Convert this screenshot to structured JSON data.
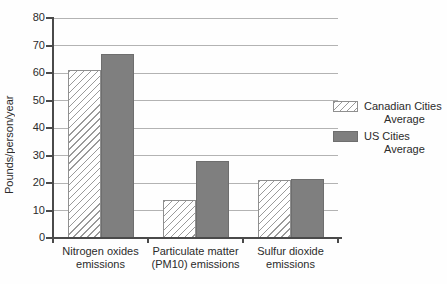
{
  "chart_data": {
    "type": "bar",
    "title": "",
    "xlabel": "",
    "ylabel": "Pounds/person/year",
    "ylim": [
      0,
      80
    ],
    "ytick_step": 10,
    "grid": true,
    "legend_position": "right",
    "categories": [
      "Nitrogen oxides emissions",
      "Particulate matter (PM10) emissions",
      "Sulfur dioxide emissions"
    ],
    "series": [
      {
        "name": "Canadian Cities Average",
        "style": "hatched",
        "values": [
          61,
          14,
          21
        ]
      },
      {
        "name": "US Cities Average",
        "style": "solid",
        "values": [
          67,
          28,
          21.5
        ]
      }
    ],
    "colors": {
      "us_bar_fill": "#7f7f7f",
      "us_bar_border": "#6e6e6e",
      "canadian_bar_bg": "#ffffff",
      "hatch_line": "#9a9a9a",
      "canadian_bar_border": "#8f8f8f",
      "gridline": "#b3b3b3",
      "axis": "#4a4a4a",
      "text": "#2b2b2b"
    }
  },
  "legend": {
    "items": [
      {
        "line1": "Canadian Cities",
        "line2": "Average"
      },
      {
        "line1": "US Cities",
        "line2": "Average"
      }
    ]
  }
}
